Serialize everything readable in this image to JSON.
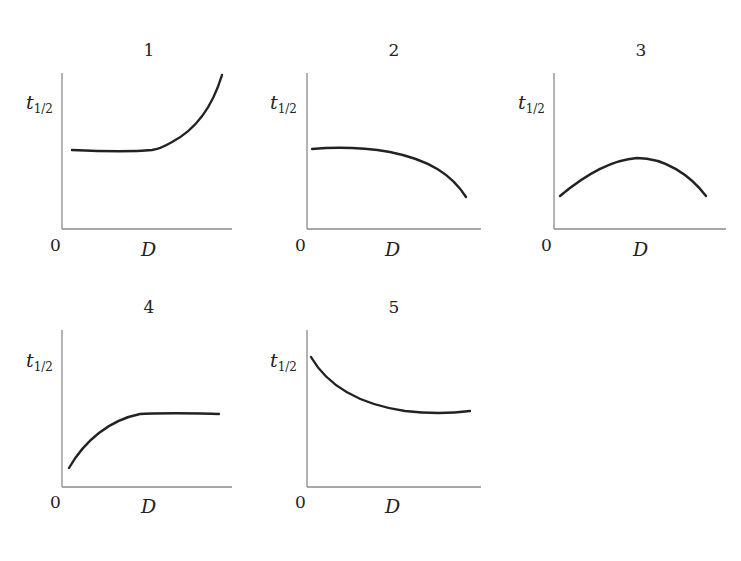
{
  "chart_data": [
    {
      "type": "line",
      "title": "1",
      "xlabel": "D",
      "ylabel": "t1/2",
      "ylabel_main": "t",
      "ylabel_sub": "1/2",
      "origin_label": "0",
      "description": "flat then increasing",
      "shape": "constant at low-mid level, then rising steeply",
      "x": [
        0.05,
        0.3,
        0.55,
        0.6,
        0.75,
        0.9,
        0.95
      ],
      "y": [
        0.5,
        0.5,
        0.5,
        0.52,
        0.65,
        0.88,
        1.0
      ]
    },
    {
      "type": "line",
      "title": "2",
      "xlabel": "D",
      "ylabel": "t1/2",
      "ylabel_main": "t",
      "ylabel_sub": "1/2",
      "origin_label": "0",
      "description": "slowly then rapidly decreasing",
      "shape": "near-flat then concave-down decline",
      "x": [
        0.03,
        0.2,
        0.5,
        0.75,
        0.91
      ],
      "y": [
        0.52,
        0.53,
        0.48,
        0.35,
        0.2
      ]
    },
    {
      "type": "line",
      "title": "3",
      "xlabel": "D",
      "ylabel": "t1/2",
      "ylabel_main": "t",
      "ylabel_sub": "1/2",
      "origin_label": "0",
      "description": "rises to maximum then falls",
      "shape": "inverted parabola",
      "x": [
        0.04,
        0.25,
        0.48,
        0.7,
        0.88
      ],
      "y": [
        0.21,
        0.38,
        0.46,
        0.38,
        0.21
      ]
    },
    {
      "type": "line",
      "title": "4",
      "xlabel": "D",
      "ylabel": "t1/2",
      "ylabel_main": "t",
      "ylabel_sub": "1/2",
      "origin_label": "0",
      "description": "increasing then plateau",
      "shape": "concave-down rise then constant",
      "x": [
        0.04,
        0.2,
        0.38,
        0.49,
        0.7,
        0.92
      ],
      "y": [
        0.12,
        0.3,
        0.43,
        0.47,
        0.47,
        0.47
      ]
    },
    {
      "type": "line",
      "title": "5",
      "xlabel": "D",
      "ylabel": "t1/2",
      "ylabel_main": "t",
      "ylabel_sub": "1/2",
      "origin_label": "0",
      "description": "decreasing then leveling off",
      "shape": "convex decay approaching a constant",
      "x": [
        0.02,
        0.2,
        0.4,
        0.6,
        0.8,
        0.94
      ],
      "y": [
        0.83,
        0.6,
        0.5,
        0.47,
        0.47,
        0.48
      ]
    }
  ],
  "panels": [
    {
      "id": "1",
      "label": "1",
      "zero": "0",
      "xlabel": "D",
      "ylabel_main": "t",
      "ylabel_sub": "1/2",
      "origin": [
        62,
        229
      ],
      "yaxis_top": 73,
      "xaxis_right": 232,
      "title_pos": [
        149,
        56
      ],
      "ylab_pos": [
        26,
        109
      ],
      "zero_pos": [
        50,
        251
      ],
      "xlab_pos": [
        141,
        256
      ],
      "curve": "M72,150 C95,151 130,152 152,150 C160,149 165,146 172,142 C195,130 212,108 222,75"
    },
    {
      "id": "2",
      "label": "2",
      "zero": "0",
      "xlabel": "D",
      "ylabel_main": "t",
      "ylabel_sub": "1/2",
      "origin": [
        307,
        229
      ],
      "yaxis_top": 73,
      "xaxis_right": 481,
      "title_pos": [
        394,
        56
      ],
      "ylab_pos": [
        270,
        109
      ],
      "zero_pos": [
        295,
        251
      ],
      "xlab_pos": [
        385,
        256
      ],
      "curve": "M312,149 C335,147 360,147 390,152 C430,160 452,175 466,197"
    },
    {
      "id": "3",
      "label": "3",
      "zero": "0",
      "xlabel": "D",
      "ylabel_main": "t",
      "ylabel_sub": "1/2",
      "origin": [
        554,
        229
      ],
      "yaxis_top": 73,
      "xaxis_right": 726,
      "title_pos": [
        641,
        56
      ],
      "ylab_pos": [
        518,
        109
      ],
      "zero_pos": [
        541,
        251
      ],
      "xlab_pos": [
        633,
        256
      ],
      "curve": "M560,196 C585,175 610,160 637,158 C665,158 690,175 706,196"
    },
    {
      "id": "4",
      "label": "4",
      "zero": "0",
      "xlabel": "D",
      "ylabel_main": "t",
      "ylabel_sub": "1/2",
      "origin": [
        62,
        487
      ],
      "yaxis_top": 330,
      "xaxis_right": 232,
      "title_pos": [
        149,
        313
      ],
      "ylab_pos": [
        26,
        367
      ],
      "zero_pos": [
        50,
        508
      ],
      "xlab_pos": [
        141,
        513
      ],
      "curve": "M69,468 C85,440 110,420 140,414 C150,413 200,413 219,414"
    },
    {
      "id": "5",
      "label": "5",
      "zero": "0",
      "xlabel": "D",
      "ylabel_main": "t",
      "ylabel_sub": "1/2",
      "origin": [
        307,
        487
      ],
      "yaxis_top": 330,
      "xaxis_right": 481,
      "title_pos": [
        394,
        313
      ],
      "ylab_pos": [
        270,
        367
      ],
      "zero_pos": [
        295,
        508
      ],
      "xlab_pos": [
        385,
        513
      ],
      "curve": "M311,357 C330,390 365,405 405,411 C430,414 455,413 470,411"
    }
  ],
  "colors": {
    "axis": "#8a8a8a",
    "curve": "#222222",
    "text": "#222222",
    "background": "#ffffff"
  }
}
